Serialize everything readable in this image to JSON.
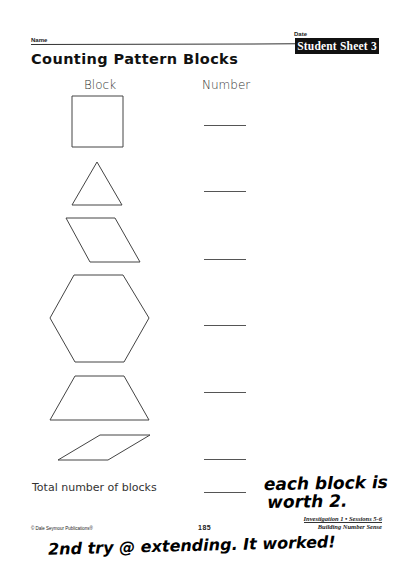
{
  "header": {
    "name_label": "Name",
    "date_label": "Date",
    "sheet_badge": "Student Sheet 3",
    "title": "Counting Pattern Blocks"
  },
  "columns": {
    "block": "Block",
    "number": "Number"
  },
  "rows": [
    {
      "shape": "square",
      "number": ""
    },
    {
      "shape": "triangle",
      "number": ""
    },
    {
      "shape": "blue-rhombus",
      "number": ""
    },
    {
      "shape": "hexagon",
      "number": ""
    },
    {
      "shape": "trapezoid",
      "number": ""
    },
    {
      "shape": "thin-rhombus",
      "number": ""
    }
  ],
  "total": {
    "label": "Total number of blocks",
    "value": ""
  },
  "handwritten": {
    "note_right_line1": "each block is",
    "note_right_line2": "worth 2.",
    "note_bottom": "2nd try @ extending. It worked!"
  },
  "footer": {
    "investigation": "Investigation 1 • Sessions 5-6",
    "unit": "Building Number Sense",
    "copyright": "© Dale Seymour Publications®",
    "page_number": "185"
  }
}
